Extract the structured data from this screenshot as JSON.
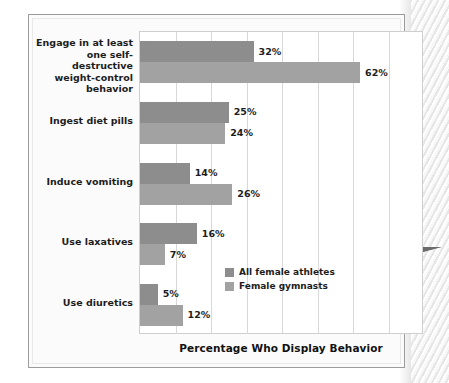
{
  "chart_data": {
    "type": "bar",
    "orientation": "horizontal",
    "title": "",
    "xlabel": "Percentage Who Display Behavior",
    "ylabel": "",
    "xlim": [
      0,
      80
    ],
    "grid": true,
    "gridline_values": [
      0,
      10,
      20,
      30,
      40,
      50,
      60,
      70,
      80
    ],
    "legend_position": "inside-bottom-right",
    "value_suffix": "%",
    "categories": [
      "Engage in at least one self-destructive weight-control behavior",
      "Ingest diet pills",
      "Induce vomiting",
      "Use laxatives",
      "Use diuretics"
    ],
    "category_lines": [
      [
        "Engage in at least",
        "one self-destructive",
        "weight-control",
        "behavior"
      ],
      [
        "Ingest diet pills"
      ],
      [
        "Induce vomiting"
      ],
      [
        "Use laxatives"
      ],
      [
        "Use diuretics"
      ]
    ],
    "series": [
      {
        "name": "All female athletes",
        "color": "#8d8d8d",
        "values": [
          32,
          25,
          14,
          16,
          5
        ],
        "labels": [
          "32%",
          "25%",
          "14%",
          "16%",
          "5%"
        ]
      },
      {
        "name": "Female gymnasts",
        "color": "#a2a2a2",
        "values": [
          62,
          24,
          26,
          7,
          12
        ],
        "labels": [
          "62%",
          "24%",
          "26%",
          "7%",
          "12%"
        ]
      }
    ]
  },
  "figure": {
    "axis_title": "Percentage Who Display Behavior",
    "legend": [
      {
        "label": "All female athletes",
        "swatch": "#8d8d8d"
      },
      {
        "label": "Female gymnasts",
        "swatch": "#a2a2a2"
      }
    ]
  }
}
